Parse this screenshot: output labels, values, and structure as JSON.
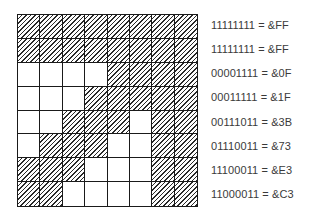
{
  "figure": {
    "type": "8x8 bitmap character grid with binary/hex row encodings",
    "rows": [
      {
        "bits": "11111111",
        "hex": "&FF",
        "text": "11111111 = &FF"
      },
      {
        "bits": "11111111",
        "hex": "&FF",
        "text": "11111111 = &FF"
      },
      {
        "bits": "00001111",
        "hex": "&0F",
        "text": "00001111 = &0F"
      },
      {
        "bits": "00011111",
        "hex": "&1F",
        "text": "00011111 = &1F"
      },
      {
        "bits": "00111011",
        "hex": "&3B",
        "text": "00111011 = &3B"
      },
      {
        "bits": "01110011",
        "hex": "&73",
        "text": "01110011 = &73"
      },
      {
        "bits": "11100011",
        "hex": "&E3",
        "text": "11100011 = &E3"
      },
      {
        "bits": "11000011",
        "hex": "&C3",
        "text": "11000011 = &C3"
      }
    ],
    "colors": {
      "line": "#1a1a1a",
      "hatch": "#2a2a2a",
      "text": "#3a3a3a",
      "background": "#ffffff"
    }
  }
}
